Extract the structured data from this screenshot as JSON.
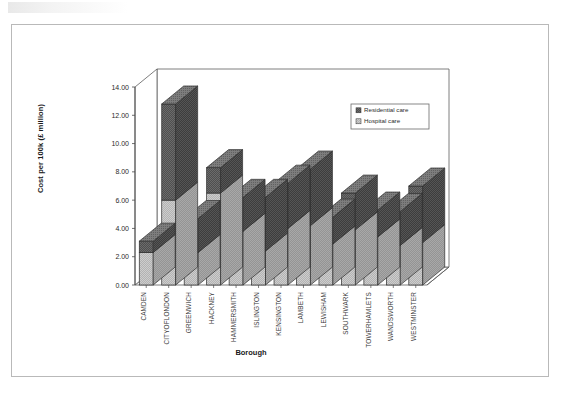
{
  "chart_data": {
    "type": "bar",
    "subtype": "stacked-3d-column",
    "title": "",
    "xlabel": "Borough",
    "ylabel": "Cost per 100k (£ million)",
    "ylim": [
      0.0,
      14.0
    ],
    "ytick_step": 2.0,
    "ytick_labels": [
      "0.00",
      "2.00",
      "4.00",
      "6.00",
      "8.00",
      "10.00",
      "12.00",
      "14.00"
    ],
    "ytick_values": [
      0.0,
      2.0,
      4.0,
      6.0,
      8.0,
      10.0,
      12.0,
      14.0
    ],
    "grid": false,
    "legend_position": "top-right",
    "categories": [
      "CAMDEN",
      "CITYOFLONDON",
      "GREENWICH",
      "HACKNEY",
      "HAMMERSMITH",
      "ISLINGTON",
      "KENSINGTON",
      "LAMBETH",
      "LEWISHAM",
      "SOUTHWARK",
      "TOWERHAMLETS",
      "WANDSWORTH",
      "WESTMINSTER"
    ],
    "series": [
      {
        "name": "Hospital care",
        "color": "#c6c6c6",
        "values": [
          2.3,
          6.0,
          2.3,
          6.5,
          3.8,
          2.4,
          4.0,
          4.2,
          2.9,
          3.9,
          3.4,
          2.8,
          3.0
        ]
      },
      {
        "name": "Residential care",
        "color": "#595959",
        "values": [
          0.8,
          6.8,
          2.4,
          1.8,
          2.4,
          3.8,
          3.2,
          4.0,
          1.9,
          2.6,
          1.9,
          2.4,
          4.0
        ]
      }
    ],
    "totals": [
      3.1,
      12.8,
      4.7,
      8.3,
      6.2,
      6.2,
      7.2,
      8.2,
      4.8,
      6.5,
      5.3,
      5.2,
      7.0
    ]
  },
  "legend": {
    "entries": [
      {
        "label": "Residential care",
        "swatch": "#595959"
      },
      {
        "label": "Hospital care",
        "swatch": "#c6c6c6"
      }
    ]
  }
}
